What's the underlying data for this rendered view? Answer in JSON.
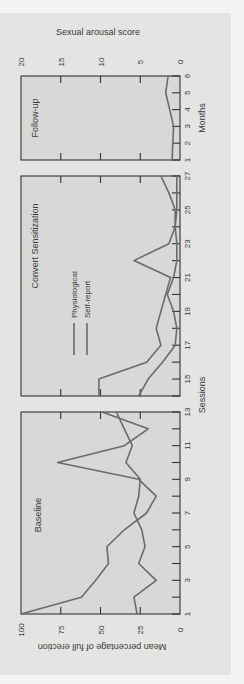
{
  "chart_data": {
    "type": "line",
    "orientation": "rotated-90-ccw",
    "title": "",
    "xlabel": "Sessions",
    "ylabel": "Mean percentage of full erection",
    "ylim": [
      0,
      100
    ],
    "y_ticks": [
      0,
      25,
      50,
      75,
      100
    ],
    "secondary_axis": {
      "label": "Sexual arousal score",
      "ticks": [
        0,
        5,
        10,
        15,
        20
      ],
      "lim": [
        0,
        20
      ],
      "applies_to": "Follow-up"
    },
    "legend": [
      {
        "name": "Physiological",
        "style": "solid"
      },
      {
        "name": "Self-report",
        "style": "solid"
      }
    ],
    "panels": [
      {
        "name": "Baseline",
        "x_label": "Sessions",
        "x": [
          1,
          2,
          3,
          4,
          5,
          6,
          7,
          8,
          9,
          10,
          11,
          12,
          13
        ],
        "x_tick_labels": [
          1,
          3,
          5,
          7,
          9,
          11,
          13
        ],
        "series": [
          {
            "name": "Physiological",
            "values": [
              100,
              62,
              53,
              45,
              46,
              35,
              21,
              15,
              26,
              77,
              35,
              20,
              49
            ]
          },
          {
            "name": "Self-report",
            "values": [
              27,
              29,
              15,
              26,
              22,
              24,
              29,
              26,
              25,
              34,
              30,
              35,
              40
            ]
          }
        ]
      },
      {
        "name": "Convert Sensitization",
        "x_label": "Sessions",
        "x": [
          14,
          15,
          16,
          17,
          18,
          19,
          20,
          21,
          22,
          23,
          24,
          25,
          26,
          27
        ],
        "x_tick_labels": [
          15,
          17,
          19,
          21,
          23,
          25,
          27
        ],
        "series": [
          {
            "name": "Physiological",
            "values": [
              51,
              51,
              21,
              12,
              15,
              12,
              9,
              6,
              29,
              7,
              3,
              3,
              7,
              12
            ]
          },
          {
            "name": "Self-report",
            "values": [
              26,
              20,
              11,
              3,
              2,
              4,
              8,
              4,
              2,
              2,
              3,
              2,
              2,
              2
            ]
          }
        ]
      },
      {
        "name": "Follow-up",
        "x_label": "Months",
        "x": [
          1,
          2,
          3,
          4,
          5,
          6
        ],
        "x_tick_labels": [
          1,
          2,
          3,
          4,
          5,
          6
        ],
        "scale": "Sexual arousal score",
        "series": [
          {
            "name": "Sexual arousal score",
            "values": [
              1.0,
              0.9,
              0.8,
              1.3,
              1.8,
              1.5
            ]
          }
        ]
      }
    ]
  },
  "labels": {
    "top_axis_title": "Sexual arousal score",
    "bottom_axis_title": "Mean percentage of full erection",
    "sessions": "Sessions",
    "months": "Months",
    "panel_baseline": "Baseline",
    "panel_convert": "Convert Sensitization",
    "panel_followup": "Follow-up",
    "legend_physiological": "Physiological",
    "legend_selfreport": "Self-report"
  },
  "colors": {
    "line": "#6b6b6b",
    "axis": "#333333",
    "panel_fill": "#d8d8d6",
    "card": "#e4e4e2"
  }
}
